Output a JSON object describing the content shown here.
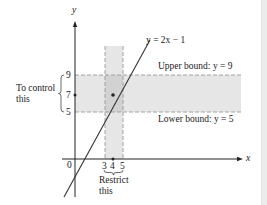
{
  "diagram": {
    "axes": {
      "x_label": "x",
      "y_label": "y",
      "origin_label": "0"
    },
    "line": {
      "equation": "y = 2x − 1"
    },
    "upper_bound": {
      "label": "Upper bound: y = 9",
      "value": 9
    },
    "lower_bound": {
      "label": "Lower bound: y = 5",
      "value": 5
    },
    "y_ticks": [
      "9",
      "7",
      "5"
    ],
    "x_ticks": [
      "3",
      "4",
      "5"
    ],
    "left_annotation": {
      "line1": "To control",
      "line2": "this"
    },
    "bottom_annotation": {
      "line1": "Restrict",
      "line2": "this"
    },
    "highlighted_point": {
      "x": 4,
      "y": 7
    },
    "colors": {
      "band": "#e6e6e6",
      "band_overlap": "#d2d2d2",
      "dashed": "#9a9a9a",
      "line": "#333333",
      "axis": "#222222"
    }
  }
}
